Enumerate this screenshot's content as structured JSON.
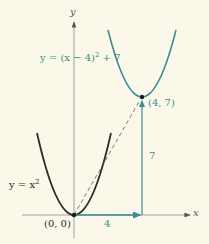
{
  "diagram": {
    "axes": {
      "x_label": "x",
      "y_label": "y"
    },
    "curves": [
      {
        "name": "base-parabola",
        "label": "y = x",
        "exp": "2",
        "color": "#2a2a2a"
      },
      {
        "name": "shifted-parabola",
        "label": "y = (x − 4)",
        "exp": "2",
        "label_tail": " + 7",
        "color": "#3a8d96"
      }
    ],
    "points": [
      {
        "label": "(0, 0)"
      },
      {
        "label": "(4, 7)"
      }
    ],
    "shift": {
      "horizontal_label": "4",
      "vertical_label": "7",
      "color": "#3a8d96"
    },
    "colors": {
      "background": "#fbf8ea",
      "axis": "#8a8a8a",
      "teal": "#3a8d96",
      "dark": "#2a2a2a"
    }
  }
}
